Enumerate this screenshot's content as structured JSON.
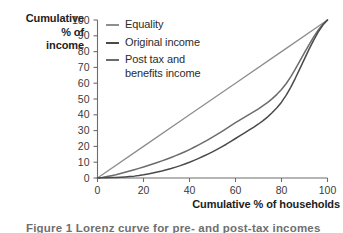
{
  "figure": {
    "caption_partial": "Figure 1 Lorenz curve for pre- and post-tax incomes"
  },
  "axes": {
    "y_title_lines": "Cumulative\n% of\nincome",
    "x_title": "Cumulative % of households",
    "y_ticks": [
      0,
      10,
      20,
      30,
      40,
      50,
      60,
      70,
      80,
      90,
      100
    ],
    "x_ticks": [
      0,
      20,
      40,
      60,
      80,
      100
    ]
  },
  "legend": {
    "position": "top-left-inside",
    "items": [
      {
        "label": "Equality",
        "color": "#8e8e8e"
      },
      {
        "label": "Original income",
        "color": "#4a4a4a"
      },
      {
        "label": "Post tax and\nbenefits income",
        "color": "#6b6b6b"
      }
    ]
  },
  "chart_data": {
    "type": "line",
    "title": "",
    "subtitle": "",
    "xlabel": "Cumulative % of households",
    "ylabel": "Cumulative % of income",
    "xlim": [
      0,
      100
    ],
    "ylim": [
      0,
      100
    ],
    "xticks": [
      0,
      20,
      40,
      60,
      80,
      100
    ],
    "yticks": [
      0,
      10,
      20,
      30,
      40,
      50,
      60,
      70,
      80,
      90,
      100
    ],
    "grid": false,
    "legend_position": "upper left",
    "x": [
      0,
      20,
      40,
      60,
      80,
      100
    ],
    "series": [
      {
        "name": "Equality",
        "color": "#8e8e8e",
        "values": [
          0,
          20,
          40,
          60,
          80,
          100
        ]
      },
      {
        "name": "Post tax and benefits income",
        "color": "#6b6b6b",
        "values": [
          0,
          7,
          18,
          35,
          56,
          100
        ]
      },
      {
        "name": "Original income",
        "color": "#4a4a4a",
        "values": [
          0,
          2,
          10,
          25,
          48,
          100
        ]
      }
    ],
    "annotations": []
  }
}
